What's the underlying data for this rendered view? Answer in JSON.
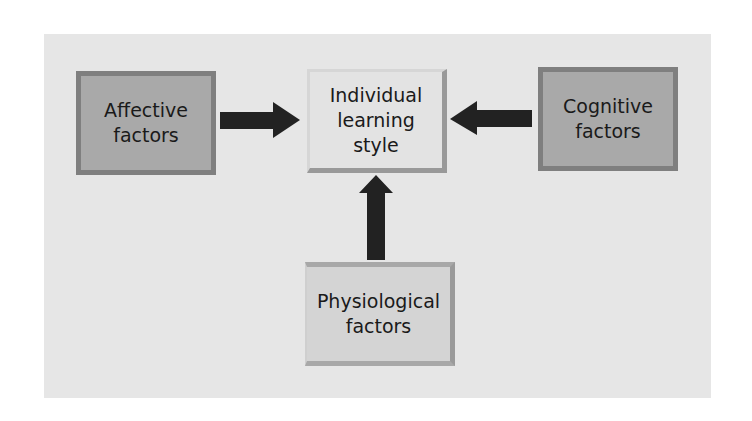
{
  "diagram": {
    "nodes": {
      "affective": {
        "label": "Affective\nfactors"
      },
      "center": {
        "label": "Individual\nlearning\nstyle"
      },
      "cognitive": {
        "label": "Cognitive\nfactors"
      },
      "physiological": {
        "label": "Physiological\nfactors"
      }
    },
    "edges": [
      {
        "from": "Affective factors",
        "to": "Individual learning style"
      },
      {
        "from": "Cognitive factors",
        "to": "Individual learning style"
      },
      {
        "from": "Physiological factors",
        "to": "Individual learning style"
      }
    ],
    "colors": {
      "panel": "#e6e6e6",
      "outer_box_fill": "#a9a9a9",
      "outer_box_border": "#7f7f7f",
      "center_box_fill": "#e3e3e3",
      "arrow": "#222222"
    }
  }
}
